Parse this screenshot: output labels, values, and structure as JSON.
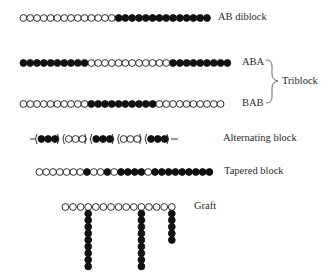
{
  "diagram": {
    "bead_radius": 3.4,
    "bead_spacing": 6.8,
    "chains": [
      {
        "id": "ab-diblock",
        "label": "AB diblock",
        "x": 20,
        "y": 18,
        "sequence": "oooooooooooooo**************",
        "label_pos": {
          "x": 218,
          "y": 11
        }
      },
      {
        "id": "aba-triblock",
        "label": "ABA",
        "x": 20,
        "y": 63,
        "sequence": "**********oooooooooooo*********",
        "label_pos": {
          "x": 242,
          "y": 56
        }
      },
      {
        "id": "bab-triblock",
        "label": "BAB",
        "x": 20,
        "y": 104,
        "sequence": "oooooooooo**********oooooooooo",
        "label_pos": {
          "x": 242,
          "y": 97
        }
      },
      {
        "id": "tapered-block",
        "label": "Tapered block",
        "x": 36,
        "y": 172,
        "sequence": "ooooooo*oo*o****o*********",
        "label_pos": {
          "x": 224,
          "y": 165
        }
      }
    ],
    "triblock_group": {
      "label": "Triblock",
      "label_pos": {
        "x": 282,
        "y": 76
      }
    },
    "alternating": {
      "label": "Alternating block",
      "y": 139,
      "x": 30,
      "groups": [
        "***",
        "ooo",
        "***",
        "ooo",
        "***"
      ],
      "label_pos": {
        "x": 223,
        "y": 132
      }
    },
    "graft": {
      "label": "Graft",
      "backbone_x": 62,
      "y": 207,
      "backbone_count": 15,
      "branches": [
        {
          "index": 4,
          "length": 9
        },
        {
          "index": 11,
          "length": 9
        },
        {
          "index": 15,
          "length": 5
        }
      ],
      "label_pos": {
        "x": 194,
        "y": 200
      }
    },
    "legend": {
      "open_bead": "monomer A (open circle)",
      "filled_bead": "monomer B (filled circle)"
    }
  }
}
